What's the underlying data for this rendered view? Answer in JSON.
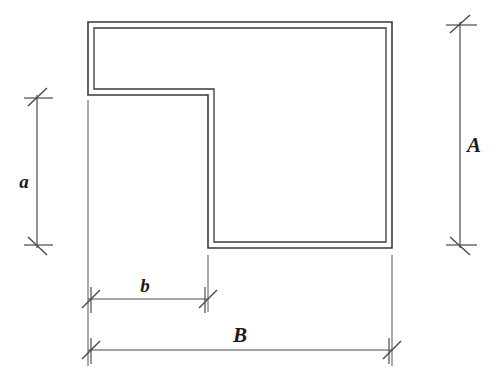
{
  "drawing": {
    "title": "L-shaped cross-section dimension diagram",
    "background_color": "#ffffff",
    "line_color": "#3a3a3a",
    "dimension_line_color": "#4a4a4a",
    "label_color": "#1a1a1a"
  },
  "labels": {
    "height_overall": "A",
    "height_leg": "a",
    "width_leg": "b",
    "width_overall": "B"
  },
  "geometry": {
    "outer": {
      "left": 88,
      "top": 22,
      "right": 392,
      "bottom": 248,
      "step_x": 208,
      "step_y": 95
    },
    "wall_thickness": 6
  },
  "dimensions": [
    {
      "name": "A",
      "orientation": "vertical",
      "axis_position": 460,
      "from": 22,
      "to": 248,
      "label": "A",
      "label_x": 474,
      "label_y": 152
    },
    {
      "name": "a",
      "orientation": "vertical",
      "axis_position": 37,
      "from": 95,
      "to": 248,
      "label": "a",
      "label_x": 24,
      "label_y": 188
    },
    {
      "name": "b",
      "orientation": "horizontal",
      "axis_position": 299,
      "from": 88,
      "to": 208,
      "label": "b",
      "label_x": 145,
      "label_y": 290
    },
    {
      "name": "B",
      "orientation": "horizontal",
      "axis_position": 350,
      "from": 88,
      "to": 392,
      "label": "B",
      "label_x": 240,
      "label_y": 340
    }
  ]
}
